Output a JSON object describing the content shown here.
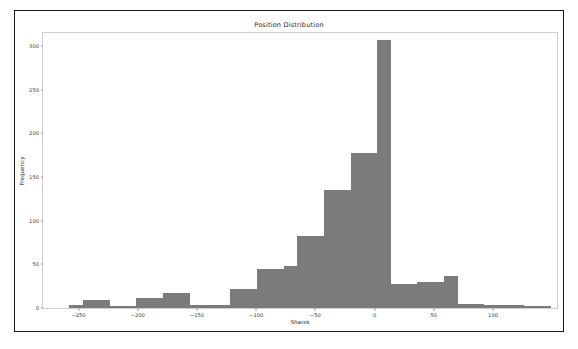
{
  "chart_data": {
    "type": "bar",
    "title": "Position Distribution",
    "xlabel": "Shares",
    "ylabel": "Frequency",
    "grid": false,
    "legend": false,
    "xlim": [
      -280.0,
      154.0
    ],
    "ylim": [
      0,
      315
    ],
    "xticks": [
      -250,
      -200,
      -150,
      -100,
      -50,
      0,
      50,
      100
    ],
    "xtick_labels": [
      "−250",
      "−200",
      "−150",
      "−100",
      "−50",
      "0",
      "50",
      "100"
    ],
    "yticks": [
      0,
      50,
      100,
      150,
      200,
      250,
      300
    ],
    "ytick_labels": [
      "0",
      "50",
      "100",
      "150",
      "200",
      "250",
      "300"
    ],
    "bin_width": 11.3,
    "bar_color": "#7b7b7b",
    "bin_edges": [
      -280.0,
      -268.7,
      -257.4,
      -246.1,
      -234.8,
      -223.5,
      -212.2,
      -200.9,
      -189.6,
      -178.3,
      -167.0,
      -155.7,
      -144.4,
      -133.1,
      -121.8,
      -110.5,
      -99.2,
      -87.9,
      -76.6,
      -65.3,
      -54.0,
      -42.7,
      -31.4,
      -20.1,
      -8.8,
      2.5,
      13.8,
      25.1,
      36.4,
      47.7,
      59.0,
      70.3,
      81.6,
      92.9,
      104.2,
      115.5,
      126.8,
      138.1,
      149.4
    ],
    "categories": [
      "-274",
      "-263",
      "-252",
      "-240",
      "-229",
      "-218",
      "-207",
      "-195",
      "-184",
      "-173",
      "-161",
      "-150",
      "-139",
      "-127",
      "-116",
      "-105",
      "-94",
      "-82",
      "-71",
      "-60",
      "-48",
      "-37",
      "-26",
      "-14",
      "-3",
      "8",
      "19",
      "31",
      "42",
      "53",
      "65",
      "76",
      "87",
      "99",
      "110",
      "121",
      "133",
      "144"
    ],
    "values": [
      0,
      0,
      3,
      9,
      9,
      2,
      2,
      12,
      12,
      17,
      17,
      3,
      3,
      22,
      22,
      45,
      45,
      48,
      48,
      83,
      83,
      135,
      135,
      178,
      178,
      307,
      307,
      28,
      28,
      30,
      30,
      37,
      37,
      4,
      4,
      4,
      2,
      2
    ],
    "bars": [
      {
        "x_center": -252.0,
        "width": 11.3,
        "value": 3
      },
      {
        "x_center": -240.7,
        "width": 11.3,
        "value": 9
      },
      {
        "x_center": -229.4,
        "width": 11.3,
        "value": 9
      },
      {
        "x_center": -218.1,
        "width": 11.3,
        "value": 2
      },
      {
        "x_center": -206.8,
        "width": 11.3,
        "value": 2
      },
      {
        "x_center": -195.5,
        "width": 11.3,
        "value": 12
      },
      {
        "x_center": -184.2,
        "width": 11.3,
        "value": 12
      },
      {
        "x_center": -172.9,
        "width": 11.3,
        "value": 17
      },
      {
        "x_center": -161.6,
        "width": 11.3,
        "value": 17
      },
      {
        "x_center": -150.3,
        "width": 11.3,
        "value": 3
      },
      {
        "x_center": -139.0,
        "width": 11.3,
        "value": 3
      },
      {
        "x_center": -127.7,
        "width": 11.3,
        "value": 3
      },
      {
        "x_center": -116.4,
        "width": 11.3,
        "value": 22
      },
      {
        "x_center": -105.1,
        "width": 11.3,
        "value": 22
      },
      {
        "x_center": -93.8,
        "width": 11.3,
        "value": 45
      },
      {
        "x_center": -82.5,
        "width": 11.3,
        "value": 45
      },
      {
        "x_center": -71.2,
        "width": 11.3,
        "value": 48
      },
      {
        "x_center": -59.9,
        "width": 11.3,
        "value": 83
      },
      {
        "x_center": -48.6,
        "width": 11.3,
        "value": 83
      },
      {
        "x_center": -37.3,
        "width": 11.3,
        "value": 135
      },
      {
        "x_center": -26.0,
        "width": 11.3,
        "value": 135
      },
      {
        "x_center": -14.7,
        "width": 11.3,
        "value": 178
      },
      {
        "x_center": -3.4,
        "width": 11.3,
        "value": 178
      },
      {
        "x_center": 7.9,
        "width": 11.3,
        "value": 307
      },
      {
        "x_center": 19.2,
        "width": 11.3,
        "value": 28
      },
      {
        "x_center": 30.5,
        "width": 11.3,
        "value": 28
      },
      {
        "x_center": 41.8,
        "width": 11.3,
        "value": 30
      },
      {
        "x_center": 53.1,
        "width": 11.3,
        "value": 30
      },
      {
        "x_center": 64.4,
        "width": 11.3,
        "value": 37
      },
      {
        "x_center": 75.7,
        "width": 11.3,
        "value": 5
      },
      {
        "x_center": 87.0,
        "width": 11.3,
        "value": 5
      },
      {
        "x_center": 98.3,
        "width": 11.3,
        "value": 4
      },
      {
        "x_center": 109.6,
        "width": 11.3,
        "value": 4
      },
      {
        "x_center": 120.9,
        "width": 11.3,
        "value": 4
      },
      {
        "x_center": 132.2,
        "width": 11.3,
        "value": 2
      },
      {
        "x_center": 143.5,
        "width": 11.3,
        "value": 2
      }
    ]
  }
}
